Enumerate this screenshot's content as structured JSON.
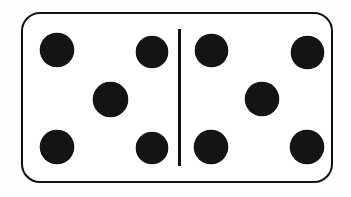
{
  "scene": {
    "subject": "domino-tile",
    "background_color": "#fefefe",
    "width": 351,
    "height": 197
  },
  "tile": {
    "name": "domino",
    "face_color": "#ffffff",
    "border_color": "#111111",
    "border_width_px": 2.6,
    "corner_radius_px": 19,
    "x": 21,
    "y": 12,
    "width": 312,
    "height": 171,
    "total_pips": 10,
    "notation": "5-5",
    "divider": {
      "name": "center-divider",
      "color": "#111111",
      "x": 179,
      "y": 30,
      "width": 2.6,
      "height": 137
    }
  },
  "halves": [
    {
      "name": "left-half",
      "pip_count": 5,
      "value_label": "5",
      "arrangement": "quincunx",
      "pip_color": "#141414",
      "pip_diameter_px": 33,
      "pips": [
        {
          "name": "pip-top-left",
          "cx": 57,
          "cy": 50,
          "d": 34
        },
        {
          "name": "pip-top-right",
          "cx": 152,
          "cy": 52,
          "d": 32
        },
        {
          "name": "pip-center",
          "cx": 110,
          "cy": 99,
          "d": 35
        },
        {
          "name": "pip-bottom-left",
          "cx": 57,
          "cy": 147,
          "d": 34
        },
        {
          "name": "pip-bottom-right",
          "cx": 152,
          "cy": 148,
          "d": 32
        }
      ]
    },
    {
      "name": "right-half",
      "pip_count": 5,
      "value_label": "5",
      "arrangement": "quincunx",
      "pip_color": "#141414",
      "pip_diameter_px": 33,
      "pips": [
        {
          "name": "pip-top-left",
          "cx": 211,
          "cy": 50,
          "d": 33
        },
        {
          "name": "pip-top-right",
          "cx": 307,
          "cy": 52,
          "d": 33
        },
        {
          "name": "pip-center",
          "cx": 262,
          "cy": 99,
          "d": 34
        },
        {
          "name": "pip-bottom-left",
          "cx": 211,
          "cy": 147,
          "d": 34
        },
        {
          "name": "pip-bottom-right",
          "cx": 307,
          "cy": 147,
          "d": 34
        }
      ]
    }
  ]
}
